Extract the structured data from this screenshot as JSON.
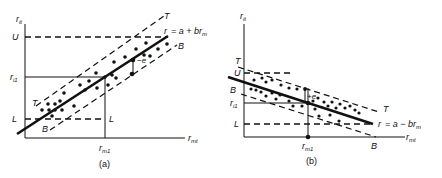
{
  "panels": [
    {
      "id": "a",
      "caption": "(a)",
      "y_axis_label": "r",
      "y_axis_sub": "it",
      "x_axis_label": "r",
      "x_axis_sub": "mt",
      "x_marker_label": "r",
      "x_marker_sub": "m1",
      "y_marker_label": "r",
      "y_marker_sub": "i1",
      "upper_limit_label": "U",
      "lower_limit_label": "L",
      "lower_limit_label_right": "L",
      "top_band_label": "T",
      "top_band_label_left": "T",
      "bottom_band_label": "B",
      "bottom_band_label_left": "B",
      "residual_label": "−e",
      "equation_r": "r",
      "equation_rest": "=  a + br",
      "equation_sub": "m"
    },
    {
      "id": "b",
      "caption": "(b)",
      "y_axis_label": "r",
      "y_axis_sub": "it",
      "x_axis_label": "r",
      "x_axis_sub": "mt",
      "x_marker_label": "r",
      "x_marker_sub": "m1",
      "y_marker_label": "r",
      "y_marker_sub": "i1",
      "upper_limit_label": "U",
      "lower_limit_label": "L",
      "top_band_label": "T",
      "top_band_label_right": "T",
      "bottom_band_label": "B",
      "bottom_band_label_right": "B",
      "residual_label": "+e",
      "equation_r": "r",
      "equation_rest": "=  a − br",
      "equation_sub": "m"
    }
  ]
}
